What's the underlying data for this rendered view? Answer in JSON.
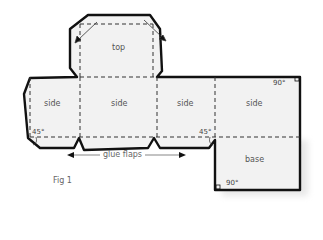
{
  "figure": {
    "caption": "Fig 1",
    "panels": {
      "top": "top",
      "side_1": "side",
      "side_2": "side",
      "side_3": "side",
      "side_4": "side",
      "base": "base"
    },
    "annotations": {
      "glue_flaps": "glue flaps",
      "angle_left": "45°",
      "angle_middle": "45°",
      "angle_top_right": "90°",
      "angle_base": "90°"
    },
    "colors": {
      "cut_line": "#111111",
      "fold_line": "#333333",
      "fill": "#f2f2f2"
    }
  }
}
